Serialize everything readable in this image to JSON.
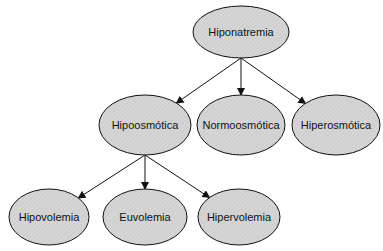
{
  "diagram": {
    "colors": {
      "node_fill": "#d4d4d4",
      "stroke": "#111111"
    },
    "nodes": [
      {
        "id": "root",
        "label": "Hiponatremia",
        "cx": 241,
        "cy": 32,
        "rx": 48,
        "ry": 26
      },
      {
        "id": "hipo",
        "label": "Hipoosmótica",
        "cx": 145,
        "cy": 125,
        "rx": 46,
        "ry": 30
      },
      {
        "id": "normo",
        "label": "Normoosmótica",
        "cx": 241,
        "cy": 125,
        "rx": 44,
        "ry": 30
      },
      {
        "id": "hiper",
        "label": "Hiperosmótica",
        "cx": 336,
        "cy": 125,
        "rx": 44,
        "ry": 30
      },
      {
        "id": "hipov",
        "label": "Hipovolemia",
        "cx": 49,
        "cy": 217,
        "rx": 40,
        "ry": 28
      },
      {
        "id": "euv",
        "label": "Euvolemia",
        "cx": 145,
        "cy": 217,
        "rx": 42,
        "ry": 28
      },
      {
        "id": "hiperv",
        "label": "Hipervolemia",
        "cx": 239,
        "cy": 217,
        "rx": 41,
        "ry": 28
      }
    ],
    "edges": [
      {
        "from": "root",
        "to": "hipo"
      },
      {
        "from": "root",
        "to": "normo"
      },
      {
        "from": "root",
        "to": "hiper"
      },
      {
        "from": "hipo",
        "to": "hipov"
      },
      {
        "from": "hipo",
        "to": "euv"
      },
      {
        "from": "hipo",
        "to": "hiperv"
      }
    ]
  }
}
